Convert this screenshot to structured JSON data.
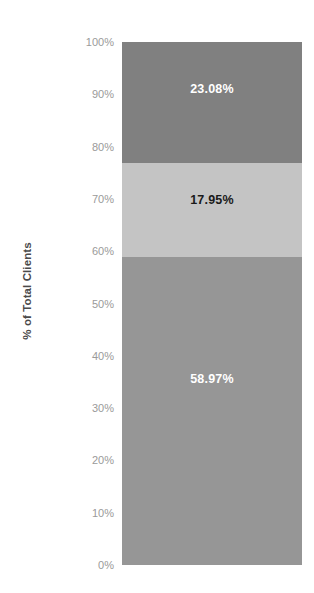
{
  "chart_data": {
    "type": "bar",
    "subtype": "stacked-100-percent",
    "orientation": "vertical",
    "title": "",
    "xlabel": "",
    "ylabel": "% of Total Clients",
    "ylim": [
      0,
      100
    ],
    "grid": false,
    "legend": "none",
    "categories": [
      ""
    ],
    "series": [
      {
        "name": "segment-bottom",
        "values": [
          58.97
        ],
        "label": "58.97%",
        "color": "#969696",
        "label_color": "#ffffff"
      },
      {
        "name": "segment-middle",
        "values": [
          17.95
        ],
        "label": "17.95%",
        "color": "#c4c4c4",
        "label_color": "#1a1a1a"
      },
      {
        "name": "segment-top",
        "values": [
          23.08
        ],
        "label": "23.08%",
        "color": "#808080",
        "label_color": "#ffffff"
      }
    ],
    "yticks": [
      {
        "value": 100,
        "label": "100%"
      },
      {
        "value": 90,
        "label": "90%"
      },
      {
        "value": 80,
        "label": "80%"
      },
      {
        "value": 70,
        "label": "70%"
      },
      {
        "value": 60,
        "label": "60%"
      },
      {
        "value": 50,
        "label": "50%"
      },
      {
        "value": 40,
        "label": "40%"
      },
      {
        "value": 30,
        "label": "30%"
      },
      {
        "value": 20,
        "label": "20%"
      },
      {
        "value": 10,
        "label": "10%"
      },
      {
        "value": 0,
        "label": "0%"
      }
    ],
    "tick_color": "#9a9a9a",
    "axis_title_color": "#4a4a4a",
    "background": "#ffffff"
  }
}
